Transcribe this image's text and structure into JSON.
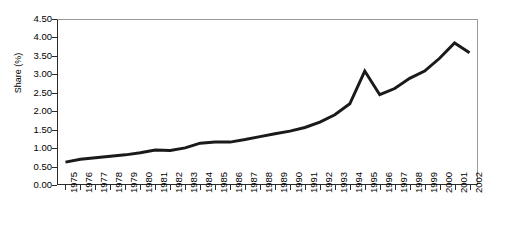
{
  "chart_data": {
    "type": "line",
    "title": "",
    "xlabel": "",
    "ylabel": "Share (%)",
    "ylim": [
      0.0,
      4.5
    ],
    "ytick_labels": [
      "0.00",
      "0.50",
      "1.00",
      "1.50",
      "2.00",
      "2.50",
      "3.00",
      "3.50",
      "4.00",
      "4.50"
    ],
    "ytick_values": [
      0.0,
      0.5,
      1.0,
      1.5,
      2.0,
      2.5,
      3.0,
      3.5,
      4.0,
      4.5
    ],
    "grid": false,
    "legend": null,
    "legend_position": "none",
    "line_color": "#1a1a1a",
    "line_width": 3,
    "categories": [
      "1975",
      "1976",
      "1977",
      "1978",
      "1979",
      "1980",
      "1981",
      "1982",
      "1983",
      "1984",
      "1985",
      "1986",
      "1987",
      "1988",
      "1989",
      "1990",
      "1991",
      "1992",
      "1993",
      "1994",
      "1995",
      "1996",
      "1997",
      "1998",
      "1999",
      "2000",
      "2001",
      "2002"
    ],
    "values": [
      0.6,
      0.68,
      0.72,
      0.76,
      0.8,
      0.86,
      0.93,
      0.92,
      0.99,
      1.12,
      1.15,
      1.15,
      1.22,
      1.3,
      1.38,
      1.45,
      1.55,
      1.7,
      1.9,
      2.2,
      3.1,
      2.45,
      2.62,
      2.9,
      3.1,
      3.45,
      3.87,
      3.6
    ]
  }
}
